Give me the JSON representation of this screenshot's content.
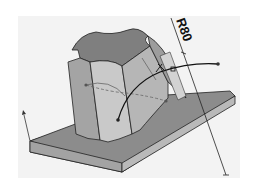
{
  "diagram": {
    "type": "cad-3d-model",
    "dimension": {
      "label": "R80",
      "kind": "radius"
    },
    "colors": {
      "background": "#ffffff",
      "viewport": "#f2f2f2",
      "plate_top": "#8c8c8c",
      "plate_front": "#9a9a9a",
      "plate_side": "#b8b8b8",
      "body_top": "#7d7d7d",
      "body_light": "#c8c8c8",
      "body_mid": "#a8a8a8",
      "body_dark": "#8f8f8f",
      "edges": "#222222",
      "curve": "#111111"
    }
  }
}
